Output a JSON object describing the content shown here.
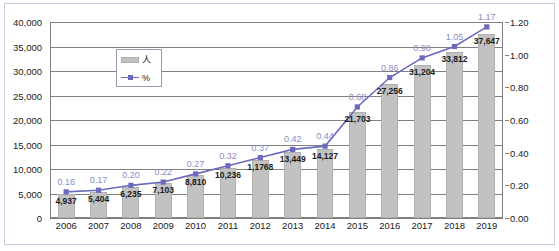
{
  "chart_data": {
    "type": "bar",
    "title": "",
    "subtitle": "",
    "xlabel": "",
    "ylabel": "",
    "y2label": "",
    "grid": true,
    "legend_position": "top-left",
    "categories": [
      "2006",
      "2007",
      "2008",
      "2009",
      "2010",
      "2011",
      "2012",
      "2013",
      "2014",
      "2015",
      "2016",
      "2017",
      "2018",
      "2019"
    ],
    "series": [
      {
        "name": "人",
        "type": "bar",
        "axis": "left",
        "color": "#c2c2c2",
        "values": [
          4937,
          5404,
          6235,
          7103,
          8810,
          10236,
          11768,
          13449,
          14127,
          21703,
          27256,
          31204,
          33812,
          37647
        ],
        "data_labels": [
          "4,937",
          "5,404",
          "6,235",
          "7,103",
          "8,810",
          "10,236",
          "1,1768",
          "13,449",
          "14,127",
          "21,703",
          "27,256",
          "31,204",
          "33,812",
          "37,647"
        ]
      },
      {
        "name": "%",
        "type": "line",
        "axis": "right",
        "color": "#6b6bbd",
        "values": [
          0.16,
          0.17,
          0.2,
          0.22,
          0.27,
          0.32,
          0.37,
          0.42,
          0.44,
          0.68,
          0.86,
          0.98,
          1.05,
          1.17
        ],
        "data_labels": [
          "0.16",
          "0.17",
          "0.20",
          "0.22",
          "0.27",
          "0.32",
          "0.37",
          "0.42",
          "0.44",
          "0.68",
          "0.86",
          "0.98",
          "1.05",
          "1.17"
        ]
      }
    ],
    "ylim": [
      0,
      40000
    ],
    "yticks": [
      0,
      5000,
      10000,
      15000,
      20000,
      25000,
      30000,
      35000,
      40000
    ],
    "ytick_labels": [
      "0",
      "5,000",
      "10,000",
      "15,000",
      "20,000",
      "25,000",
      "30,000",
      "35,000",
      "40,000"
    ],
    "y2lim": [
      0,
      1.2
    ],
    "y2ticks": [
      0,
      0.2,
      0.4,
      0.6,
      0.8,
      1.0,
      1.2
    ],
    "y2tick_labels": [
      "0.00",
      "0.20",
      "0.40",
      "0.60",
      "0.80",
      "1.00",
      "1.20"
    ]
  },
  "legend": {
    "bar_label": "人",
    "line_label": "%"
  },
  "colors": {
    "bar": "#c2c2c2",
    "line": "#6b6bbd",
    "grid": "#808080",
    "frame": "#c9c9e0",
    "text": "#1a1a1a",
    "pct_text": "#8c8cc4"
  }
}
